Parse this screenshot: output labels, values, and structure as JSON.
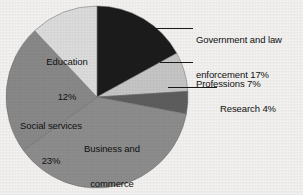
{
  "chart_data": {
    "type": "pie",
    "title": "",
    "subtitle": "",
    "xlabel": "",
    "ylabel": "",
    "legend_position": "none",
    "grid": false,
    "units": "percent",
    "total": 100,
    "start_angle_deg": 0,
    "direction": "clockwise",
    "categories": [
      "Government and law enforcement",
      "Professions",
      "Research",
      "Business and commerce",
      "Social services",
      "Education"
    ],
    "values": [
      17,
      7,
      4,
      37,
      23,
      12
    ],
    "colors": [
      "#1c1c1c",
      "#c6c6c6",
      "#5e5e5e",
      "#8d8d8d",
      "#898989",
      "#dcdcdc"
    ],
    "slices": [
      {
        "name": "Government and law enforcement",
        "label_line1": "Government and law",
        "label_line2": "enforcement 17%",
        "value": 17,
        "percent_text": "17%",
        "color": "#1c1c1c",
        "label_placement": "external-right",
        "has_leader_line": true
      },
      {
        "name": "Professions",
        "label_line1": "Professions 7%",
        "label_line2": "",
        "value": 7,
        "percent_text": "7%",
        "color": "#c6c6c6",
        "label_placement": "external-right",
        "has_leader_line": true
      },
      {
        "name": "Research",
        "label_line1": "Research 4%",
        "label_line2": "",
        "value": 4,
        "percent_text": "4%",
        "color": "#5e5e5e",
        "label_placement": "external-right",
        "has_leader_line": true
      },
      {
        "name": "Business and commerce",
        "label_line1": "Business and",
        "label_line2": "commerce",
        "label_line3": "37%",
        "value": 37,
        "percent_text": "37%",
        "color": "#8d8d8d",
        "label_placement": "internal",
        "has_leader_line": false
      },
      {
        "name": "Social services",
        "label_line1": "Social services",
        "label_line2": "23%",
        "value": 23,
        "percent_text": "23%",
        "color": "#898989",
        "label_placement": "internal",
        "has_leader_line": false
      },
      {
        "name": "Education",
        "label_line1": "Education",
        "label_line2": "12%",
        "value": 12,
        "percent_text": "12%",
        "color": "#dcdcdc",
        "label_placement": "internal",
        "has_leader_line": false
      }
    ],
    "background_color": "#f3f2f0",
    "text_color": "#111111",
    "outline_color": "#4a4a4a"
  },
  "labels": {
    "government_line1": "Government and law",
    "government_line2": "enforcement 17%",
    "professions": "Professions 7%",
    "research": "Research 4%",
    "education_line1": "Education",
    "education_line2": "12%",
    "social_line1": "Social services",
    "social_line2": "23%",
    "business_line1": "Business and",
    "business_line2": "commerce",
    "business_line3": "37%"
  }
}
